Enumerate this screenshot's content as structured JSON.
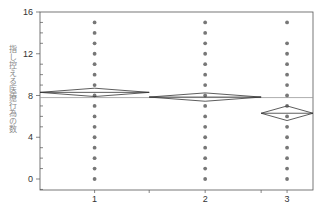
{
  "chart_data": {
    "type": "scatter",
    "subtype": "one-way ANOVA means diamonds plot",
    "title": "",
    "xlabel": "",
    "ylabel": "指し控える医療行為の数",
    "categories": [
      "1",
      "2",
      "3"
    ],
    "ylim": [
      -1,
      16
    ],
    "yticks": [
      0,
      4,
      8,
      12,
      16
    ],
    "grid": false,
    "grand_mean": 7.8,
    "group_widths": [
      0.4,
      0.41,
      0.19
    ],
    "series": [
      {
        "name": "1",
        "points": [
          0,
          1,
          2,
          3,
          4,
          5,
          6,
          7,
          8,
          9,
          10,
          11,
          12,
          13,
          14,
          15
        ],
        "mean": 8.3,
        "ci": [
          7.9,
          8.7
        ]
      },
      {
        "name": "2",
        "points": [
          0,
          1,
          2,
          3,
          4,
          5,
          6,
          7,
          8,
          9,
          10,
          11,
          12,
          13,
          14,
          15
        ],
        "mean": 7.85,
        "ci": [
          7.45,
          8.25
        ]
      },
      {
        "name": "3",
        "points": [
          0,
          1,
          2,
          3,
          4,
          5,
          6,
          7,
          8,
          9,
          10,
          11,
          12,
          13,
          15
        ],
        "mean": 6.3,
        "ci": [
          5.6,
          7.0
        ]
      }
    ]
  },
  "colors": {
    "dots": "#777777",
    "lines": "#333333",
    "mean_line": "#999999"
  }
}
